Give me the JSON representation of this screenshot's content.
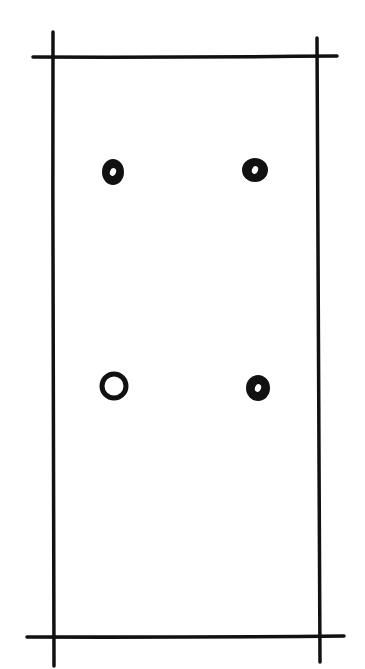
{
  "diagram": {
    "title": "",
    "caption_cropped": "",
    "stroke_color": "#111111",
    "background": "#ffffff",
    "frame": {
      "lines": [
        {
          "id": "top",
          "x1": 33,
          "y1": 57,
          "x2": 337,
          "y2": 56
        },
        {
          "id": "bottom",
          "x1": 27,
          "y1": 637,
          "x2": 344,
          "y2": 636
        },
        {
          "id": "left",
          "x1": 53,
          "y1": 32,
          "x2": 54,
          "y2": 666
        },
        {
          "id": "right",
          "x1": 317,
          "y1": 38,
          "x2": 320,
          "y2": 662
        }
      ]
    },
    "dots": [
      {
        "id": "top-left",
        "cx": 113,
        "cy": 172,
        "rx": 11,
        "ry": 13,
        "highlight": true
      },
      {
        "id": "top-right",
        "cx": 255,
        "cy": 170,
        "rx": 13,
        "ry": 12,
        "highlight": true
      },
      {
        "id": "bottom-left",
        "cx": 114,
        "cy": 386,
        "rx": 12,
        "ry": 12,
        "hollow": true
      },
      {
        "id": "bottom-right",
        "cx": 258,
        "cy": 388,
        "rx": 12,
        "ry": 13,
        "highlight": true
      }
    ]
  }
}
